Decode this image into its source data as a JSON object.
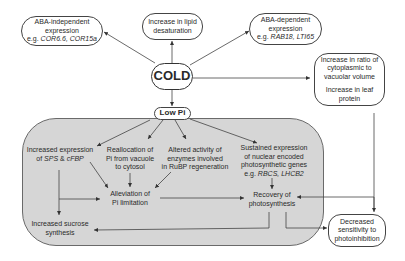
{
  "nodes": {
    "aba_independent": {
      "line1": "ABA-independent",
      "line2": "expression",
      "line3_prefix": "e.g. ",
      "line3_genes": "COR6.6, COR15a"
    },
    "lipid": {
      "line1": "Increase in lipid",
      "line2": "desaturation"
    },
    "aba_dependent": {
      "line1": "ABA-dependent",
      "line2": "expression",
      "line3_prefix": "e.g. ",
      "line3_genes": "RAB18, LTI65"
    },
    "cold": {
      "label": "COLD"
    },
    "cytoplasm": {
      "line1": "Increase in ratio of",
      "line2": "cytoplasmic to",
      "line3": "vacuolar volume",
      "line4": "Increase in leaf",
      "line5": "protein"
    },
    "low_pi": {
      "label": "Low Pi"
    },
    "sps": {
      "line1": "Increased expression",
      "line2_prefix": "of ",
      "line2_gene1": "SPS",
      "line2_mid": " & ",
      "line2_gene2": "cFBP"
    },
    "realloc": {
      "line1": "Reallocation of",
      "line2": "Pi from vacuole",
      "line3": "to cytosol"
    },
    "altered": {
      "line1": "Altered activity of",
      "line2": "enzymes involved",
      "line3": "in RuBP regeneration"
    },
    "sustained": {
      "line1": "Sustained expression",
      "line2": "of nuclear encoded",
      "line3": "photosynthetic genes",
      "line4_prefix": "e.g. ",
      "line4_genes": "RBCS, LHCB2"
    },
    "alleviation": {
      "line1": "Alleviation of",
      "line2": "Pi limitation"
    },
    "recovery": {
      "line1": "Recovery of",
      "line2": "photosynthesis"
    },
    "sucrose": {
      "line1": "Increased sucrose",
      "line2": "synthesis"
    },
    "decreased": {
      "line1": "Decreased",
      "line2": "sensitivity to",
      "line3": "photoinhibition"
    }
  },
  "colors": {
    "panel": "#d6d6d6",
    "stroke": "#444444",
    "text": "#2a2a2a"
  }
}
